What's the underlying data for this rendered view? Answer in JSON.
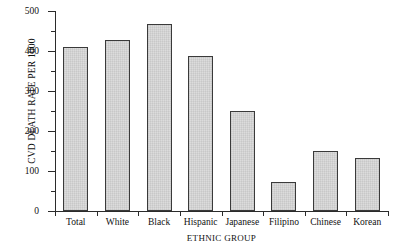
{
  "chart_data": {
    "type": "bar",
    "title": "",
    "xlabel": "ETHNIC GROUP",
    "ylabel": "CVD DEATH RATE PER 1000",
    "categories": [
      "Total",
      "White",
      "Black",
      "Hispanic",
      "Japanese",
      "Filipino",
      "Chinese",
      "Korean"
    ],
    "values": [
      410,
      428,
      468,
      387,
      250,
      73,
      150,
      133
    ],
    "ylim": [
      0,
      500
    ],
    "yticks": [
      0,
      100,
      200,
      300,
      400,
      500
    ],
    "ytick_labels": [
      "0",
      "100",
      "200",
      "300",
      "400",
      "500"
    ],
    "yminor_ticks": [
      50,
      150,
      250,
      350,
      450
    ],
    "grid": false,
    "legend": null,
    "bar_fill": "#dcdcdc",
    "bar_edge": "#3a3a3a",
    "axis_color": "#2b2b2b"
  }
}
